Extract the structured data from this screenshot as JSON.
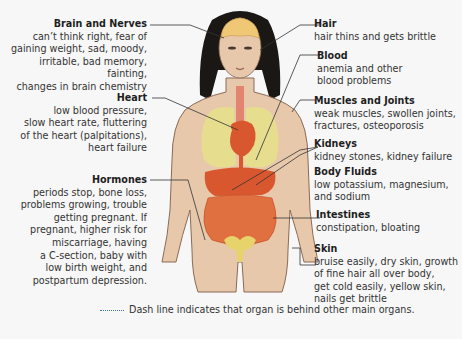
{
  "diagram": {
    "callouts_left": [
      {
        "id": "brain",
        "title": "Brain and Nerves",
        "desc_lines": [
          "can’t think right, fear of",
          "gaining weight, sad, moody,",
          "irritable, bad memory, fainting,",
          "changes in brain chemistry"
        ]
      },
      {
        "id": "heart",
        "title": "Heart",
        "desc_lines": [
          "low blood pressure,",
          "slow heart rate, fluttering",
          "of the heart (palpitations),",
          "heart failure"
        ]
      },
      {
        "id": "hormones",
        "title": "Hormones",
        "desc_lines": [
          "periods stop, bone loss,",
          "problems growing, trouble",
          "getting pregnant. If",
          "pregnant, higher risk for",
          "miscarriage, having",
          "a C-section, baby with",
          "low birth weight, and",
          "postpartum depression."
        ]
      }
    ],
    "callouts_right": [
      {
        "id": "hair",
        "title": "Hair",
        "desc_lines": [
          "hair thins and gets brittle"
        ]
      },
      {
        "id": "blood",
        "title": "Blood",
        "desc_lines": [
          "anemia and other",
          "blood problems"
        ]
      },
      {
        "id": "muscles",
        "title": "Muscles and Joints",
        "desc_lines": [
          "weak muscles, swollen joints,",
          "fractures, osteoporosis"
        ]
      },
      {
        "id": "kidneys",
        "title": "Kidneys",
        "desc_lines": [
          "kidney stones, kidney failure"
        ]
      },
      {
        "id": "fluids",
        "title": "Body Fluids",
        "desc_lines": [
          "low potassium, magnesium,",
          "and sodium"
        ]
      },
      {
        "id": "intestines",
        "title": "Intestines",
        "desc_lines": [
          "constipation, bloating"
        ]
      },
      {
        "id": "skin",
        "title": "Skin",
        "desc_lines": [
          "bruise easily, dry skin, growth",
          "of fine hair all over body,",
          "get cold easily, yellow skin,",
          "nails get brittle"
        ]
      }
    ],
    "legend": {
      "text": "Dash line indicates that organ is behind other main organs.",
      "line_style": "dotted",
      "line_color": "#3b6fb5"
    },
    "colors": {
      "background": "#f7f7f7",
      "skin": "#e8c8ab",
      "skin_outline": "#8a6a55",
      "hair": "#1b1714",
      "organs": "#d9572e",
      "lungs": "#e6e08a",
      "brain": "#f0c774",
      "leader_line": "#333333"
    }
  }
}
